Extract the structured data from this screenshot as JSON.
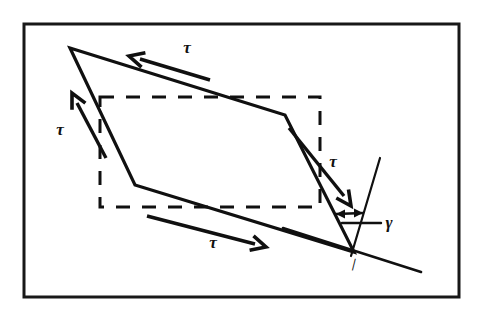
{
  "figure": {
    "background_color": "#ffffff",
    "ink_color": "#101010",
    "frame": {
      "name": "figure-border",
      "x": 24,
      "y": 24,
      "width": 435,
      "height": 273,
      "stroke_width": 3
    },
    "reference_shape": {
      "name": "undeformed-rectangle",
      "style": "dashed",
      "x": 100,
      "y": 97,
      "width": 220,
      "height": 110,
      "dash_pattern": "14 12"
    },
    "deformed_shape": {
      "name": "deformed-parallelogram",
      "style": "solid",
      "stroke_width": 3.2,
      "vertices": [
        [
          70,
          48
        ],
        [
          285,
          115
        ],
        [
          354,
          252
        ],
        [
          135,
          185
        ]
      ]
    },
    "reference_lines": [
      {
        "name": "vertical-reference-line",
        "x1": 380,
        "y1": 158,
        "x2": 351,
        "y2": 256,
        "stroke_width": 2.2
      },
      {
        "name": "horizontal-reference-line",
        "x1": 283,
        "y1": 228,
        "x2": 421,
        "y2": 272,
        "stroke_width": 2.6
      }
    ],
    "shear_arrows": [
      {
        "name": "tau-arrow-top",
        "direction": "left",
        "label": "τ",
        "label_x": 187,
        "label_y": 53,
        "shaft_x1": 210,
        "shaft_y1": 80,
        "shaft_x2": 140,
        "shaft_y2": 59,
        "head_x": 129,
        "head_y": 56
      },
      {
        "name": "tau-arrow-left",
        "direction": "up",
        "label": "τ",
        "label_x": 60,
        "label_y": 135,
        "shaft_x1": 106,
        "shaft_y1": 158,
        "shaft_x2": 77,
        "shaft_y2": 103,
        "head_x": 72,
        "head_y": 93
      },
      {
        "name": "tau-arrow-right",
        "direction": "down-right",
        "label": "τ",
        "label_x": 333,
        "label_y": 167,
        "shaft_x1": 289,
        "shaft_y1": 128,
        "shaft_x2": 344,
        "shaft_y2": 196,
        "head_x": 351,
        "head_y": 206
      },
      {
        "name": "tau-arrow-bottom",
        "direction": "right",
        "label": "τ",
        "label_x": 213,
        "label_y": 248,
        "shaft_x1": 147,
        "shaft_y1": 216,
        "shaft_x2": 255,
        "shaft_y2": 244,
        "head_x": 266,
        "head_y": 247
      }
    ],
    "angle_annotation": {
      "name": "shear-strain-angle",
      "label": "γ",
      "label_x": 389,
      "label_y": 228,
      "leader_x1": 342,
      "leader_y1": 223,
      "leader_x2": 381,
      "leader_y2": 223,
      "arc_arrow": {
        "name": "gamma-double-arrow",
        "x1": 336,
        "y1": 214,
        "x2": 363,
        "y2": 213
      },
      "vertex_x": 354,
      "vertex_y": 252
    },
    "vertex_tick": {
      "name": "vertex-tick-mark",
      "label": "∣",
      "x": 353,
      "y": 268
    }
  }
}
